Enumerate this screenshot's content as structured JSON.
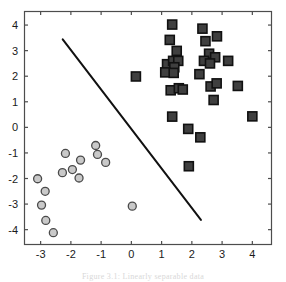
{
  "figure": {
    "caption": "Figure 3.1:  Linearly separable data"
  },
  "axes": {
    "frame_color": "#4d4d4d",
    "background": "#ffffff",
    "x_tick_labels": [
      "-3",
      "-2",
      "-1",
      "0",
      "1",
      "2",
      "3",
      "4"
    ],
    "y_tick_labels": [
      "4",
      "3",
      "2",
      "1",
      "0",
      "-1",
      "-2",
      "-3",
      "-4"
    ]
  },
  "chart_data": {
    "type": "scatter",
    "title": "",
    "xlabel": "",
    "ylabel": "",
    "xlim": [
      -3.55,
      4.65
    ],
    "ylim": [
      -4.6,
      4.55
    ],
    "xticks": [
      -3,
      -2,
      -1,
      0,
      1,
      2,
      3,
      4
    ],
    "yticks": [
      -4,
      -3,
      -2,
      -1,
      0,
      1,
      2,
      3,
      4
    ],
    "grid": false,
    "legend": "none",
    "series": [
      {
        "name": "Class +1 (squares)",
        "marker": "square",
        "fill_color": "#3f3f3f",
        "edge_color": "#111111",
        "marker_size": 9,
        "points": [
          [
            1.35,
            4.02
          ],
          [
            2.35,
            3.86
          ],
          [
            1.27,
            3.42
          ],
          [
            2.45,
            3.37
          ],
          [
            2.83,
            3.56
          ],
          [
            1.5,
            2.99
          ],
          [
            2.57,
            2.88
          ],
          [
            1.18,
            2.47
          ],
          [
            1.38,
            2.6
          ],
          [
            1.55,
            2.6
          ],
          [
            2.4,
            2.6
          ],
          [
            2.77,
            2.74
          ],
          [
            3.2,
            2.6
          ],
          [
            1.42,
            2.35
          ],
          [
            2.6,
            2.5
          ],
          [
            1.12,
            2.15
          ],
          [
            1.4,
            2.13
          ],
          [
            0.15,
            1.99
          ],
          [
            2.25,
            2.08
          ],
          [
            1.3,
            1.45
          ],
          [
            1.57,
            1.53
          ],
          [
            1.7,
            1.48
          ],
          [
            2.62,
            1.6
          ],
          [
            2.82,
            1.72
          ],
          [
            3.52,
            1.62
          ],
          [
            2.72,
            1.07
          ],
          [
            1.35,
            0.42
          ],
          [
            4.0,
            0.43
          ],
          [
            1.88,
            -0.06
          ],
          [
            2.28,
            -0.39
          ],
          [
            1.9,
            -1.52
          ]
        ]
      },
      {
        "name": "Class -1 (circles)",
        "marker": "circle",
        "fill_color": "#c9c9c9",
        "edge_color": "#4a4a4a",
        "marker_size": 8,
        "points": [
          [
            -1.18,
            -0.71
          ],
          [
            -2.18,
            -1.02
          ],
          [
            -1.12,
            -1.06
          ],
          [
            -1.68,
            -1.28
          ],
          [
            -0.85,
            -1.37
          ],
          [
            -1.95,
            -1.65
          ],
          [
            -2.28,
            -1.77
          ],
          [
            -1.73,
            -1.98
          ],
          [
            -3.1,
            -2.01
          ],
          [
            -2.85,
            -2.5
          ],
          [
            -2.97,
            -3.04
          ],
          [
            -2.83,
            -3.64
          ],
          [
            -2.58,
            -4.12
          ],
          [
            0.03,
            -3.08
          ]
        ]
      }
    ],
    "decision_boundary": {
      "name": "separating hyperplane",
      "type": "line",
      "color": "#111111",
      "width": 2,
      "x": [
        -2.27,
        2.3
      ],
      "y": [
        3.44,
        -3.62
      ]
    }
  }
}
